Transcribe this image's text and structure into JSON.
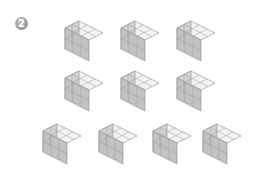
{
  "badge": {
    "label": "2"
  },
  "figure": {
    "block_dims": {
      "long": 3,
      "short": 2,
      "height": 2
    },
    "colors": {
      "top": "#f3f3f3",
      "left": "#d4d4d4",
      "right": "#c2c2c2",
      "edge": "#8c8c8c",
      "grid": "#9d9d9d"
    },
    "rows": [
      {
        "blocks": [
          {
            "x": 60,
            "y": 18
          },
          {
            "x": 116,
            "y": 18
          },
          {
            "x": 172,
            "y": 18
          }
        ]
      },
      {
        "blocks": [
          {
            "x": 60,
            "y": 68
          },
          {
            "x": 116,
            "y": 68
          },
          {
            "x": 172,
            "y": 68
          }
        ]
      },
      {
        "blocks": [
          {
            "x": 38,
            "y": 121
          },
          {
            "x": 94,
            "y": 121
          },
          {
            "x": 148,
            "y": 121
          },
          {
            "x": 198,
            "y": 121
          }
        ]
      }
    ]
  }
}
